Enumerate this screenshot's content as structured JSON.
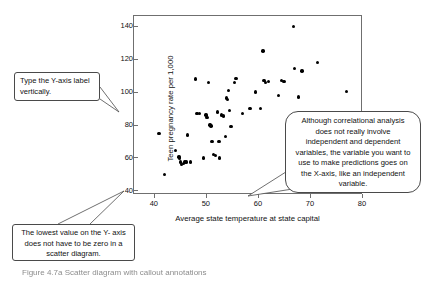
{
  "figure": {
    "caption": "Figure 4.7a Scatter diagram with callout annotations"
  },
  "callouts": {
    "yaxis_label_note": "Type the Y-axis label vertically.",
    "lowest_value_note": "The lowest value on the Y- axis does not have to be zero in a scatter diagram.",
    "xaxis_note": "Although correlational analysis does not really involve independent and dependent variables, the variable you want to use to make predictions goes on the X-axis, like an independent variable."
  },
  "chart_data": {
    "type": "scatter",
    "title": "",
    "xlabel": "Average state temperature at state capital",
    "ylabel": "Teen pregnancy rate per 1,000",
    "xlim": [
      36,
      80
    ],
    "ylim": [
      38,
      147
    ],
    "xticks": [
      40,
      50,
      60,
      70,
      80
    ],
    "yticks": [
      40,
      60,
      80,
      100,
      120,
      140
    ],
    "grid": false,
    "legend": false,
    "marker_color": "#000000",
    "frame_color": "#6f6f6f",
    "points": [
      [
        41.0,
        75.0
      ],
      [
        42.0,
        50.0
      ],
      [
        44.2,
        64.5
      ],
      [
        44.8,
        60.5
      ],
      [
        44.9,
        59.5
      ],
      [
        45.1,
        57.5
      ],
      [
        45.3,
        56.0
      ],
      [
        45.7,
        56.5
      ],
      [
        46.0,
        57.5
      ],
      [
        46.3,
        57.5
      ],
      [
        46.5,
        74.0
      ],
      [
        47.0,
        57.5
      ],
      [
        48.0,
        108.0
      ],
      [
        48.3,
        87.0
      ],
      [
        48.8,
        87.0
      ],
      [
        49.5,
        60.0
      ],
      [
        50.0,
        86.0
      ],
      [
        50.2,
        84.5
      ],
      [
        50.5,
        106.0
      ],
      [
        50.8,
        80.0
      ],
      [
        51.0,
        79.5
      ],
      [
        51.2,
        70.0
      ],
      [
        51.5,
        62.0
      ],
      [
        51.8,
        61.5
      ],
      [
        52.2,
        88.0
      ],
      [
        52.5,
        70.0
      ],
      [
        52.6,
        60.0
      ],
      [
        53.0,
        86.0
      ],
      [
        53.4,
        85.5
      ],
      [
        53.8,
        73.0
      ],
      [
        54.0,
        96.5
      ],
      [
        54.2,
        95.5
      ],
      [
        54.3,
        101.0
      ],
      [
        54.5,
        89.0
      ],
      [
        54.8,
        79.0
      ],
      [
        55.5,
        106.0
      ],
      [
        55.8,
        108.5
      ],
      [
        57.0,
        87.0
      ],
      [
        58.5,
        90.0
      ],
      [
        59.5,
        100.0
      ],
      [
        60.5,
        90.0
      ],
      [
        61.0,
        125.0
      ],
      [
        61.2,
        107.0
      ],
      [
        61.5,
        106.0
      ],
      [
        62.0,
        106.5
      ],
      [
        64.0,
        98.0
      ],
      [
        64.5,
        107.0
      ],
      [
        65.0,
        106.5
      ],
      [
        66.8,
        140.0
      ],
      [
        67.0,
        114.5
      ],
      [
        67.8,
        97.0
      ],
      [
        68.5,
        113.0
      ],
      [
        71.5,
        118.0
      ],
      [
        77.0,
        100.5
      ]
    ]
  }
}
